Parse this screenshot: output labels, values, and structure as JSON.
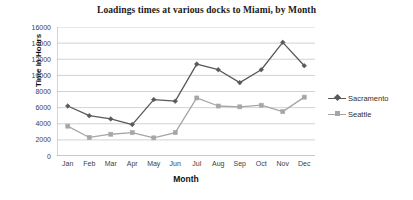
{
  "chart_data": {
    "type": "line",
    "title": "Loadings times at various docks to Miami, by Month",
    "xlabel": "Month",
    "ylabel": "Time in Hours",
    "categories": [
      "Jan",
      "Feb",
      "Mar",
      "Apr",
      "May",
      "Jun",
      "Jul",
      "Aug",
      "Sep",
      "Oct",
      "Nov",
      "Dec"
    ],
    "ylim": [
      0,
      16000
    ],
    "ytick_labels": [
      "16000",
      "14000",
      "12000",
      "10000",
      "8000",
      "6000",
      "4000",
      "2000",
      "0"
    ],
    "ytick_values": [
      16000,
      14000,
      12000,
      10000,
      8000,
      6000,
      4000,
      2000,
      0
    ],
    "grid": true,
    "legend_position": "right",
    "series": [
      {
        "name": "Sacramento",
        "color": "#595959",
        "marker": "diamond",
        "values": [
          6200,
          5000,
          4600,
          3900,
          7000,
          6800,
          11400,
          10700,
          9100,
          10700,
          14100,
          11200
        ]
      },
      {
        "name": "Seattle",
        "color": "#a6a6a6",
        "marker": "square",
        "values": [
          3700,
          2300,
          2700,
          2900,
          2250,
          2900,
          7200,
          6200,
          6100,
          6300,
          5500,
          7300
        ]
      }
    ]
  },
  "legend": {
    "items": [
      {
        "label": "Sacramento"
      },
      {
        "label": "Seattle"
      }
    ]
  }
}
